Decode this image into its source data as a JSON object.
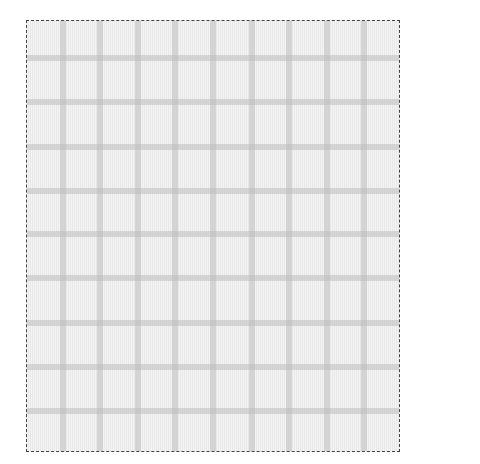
{
  "canvas": {
    "frame": {
      "left": 26,
      "top": 20,
      "width": 372,
      "height": 430,
      "border_color": "#444444",
      "border_style": "dashed"
    },
    "background_color": "#eeeeee",
    "grid_color": "#d8d8d8",
    "grid_line_thickness": 6,
    "vertical_lines_x": [
      63,
      100,
      138,
      175,
      213,
      252,
      289,
      327,
      364
    ],
    "horizontal_lines_y": [
      58,
      102,
      147,
      191,
      234,
      278,
      323,
      367,
      411
    ]
  }
}
